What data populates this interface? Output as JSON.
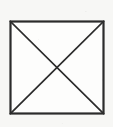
{
  "figure": {
    "title": "Square with both diagonals drawn",
    "shape_name": "square-with-diagonals",
    "background_color": "#f7f7f5",
    "fill_color": "#fdfdfc",
    "stroke_color": "#2b2b2b",
    "canvas": {
      "width": 113,
      "height": 127
    },
    "square": {
      "name": "square-outline",
      "x": 10.5,
      "y": 21.5,
      "width": 93,
      "height": 92,
      "stroke_width": 2.2,
      "corners": {
        "top_left": [
          10.5,
          21.5
        ],
        "top_right": [
          103.5,
          21.5
        ],
        "bottom_right": [
          103.5,
          113.5
        ],
        "bottom_left": [
          10.5,
          113.5
        ]
      }
    },
    "diagonals": [
      {
        "name": "diagonal-top-left-to-bottom-right",
        "x1": 10.5,
        "y1": 21.5,
        "x2": 103.5,
        "y2": 113.5,
        "stroke_width": 1.7
      },
      {
        "name": "diagonal-top-right-to-bottom-left",
        "x1": 103.5,
        "y1": 21.5,
        "x2": 10.5,
        "y2": 113.5,
        "stroke_width": 1.7
      }
    ],
    "intersection_point": {
      "name": "diagonal-intersection",
      "x": 57,
      "y": 67.5
    }
  }
}
